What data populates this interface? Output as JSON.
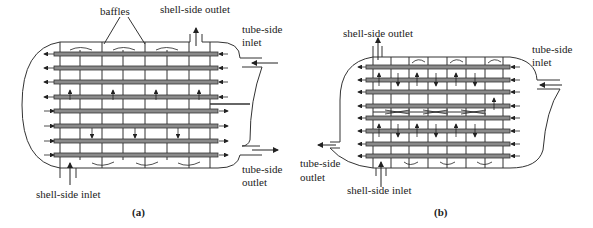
{
  "figure": {
    "panels": [
      {
        "id": "a",
        "caption": "(a)",
        "labels": {
          "baffles": "baffles",
          "shell_outlet": "shell-side outlet",
          "tube_inlet_1": "tube-side",
          "tube_inlet_2": "inlet",
          "tube_outlet_1": "tube-side",
          "tube_outlet_2": "outlet",
          "shell_inlet": "shell-side inlet"
        },
        "tube_rows": 8,
        "tube_passes": 2
      },
      {
        "id": "b",
        "caption": "(b)",
        "labels": {
          "shell_outlet": "shell-side outlet",
          "tube_inlet_1": "tube-side",
          "tube_inlet_2": "inlet",
          "tube_outlet_1": "tube-side",
          "tube_outlet_2": "outlet",
          "shell_inlet": "shell-side inlet"
        },
        "tube_rows": 8,
        "tube_passes": 1
      }
    ],
    "colors": {
      "line": "#333333",
      "tube_fill": "#8a8a8a"
    }
  }
}
